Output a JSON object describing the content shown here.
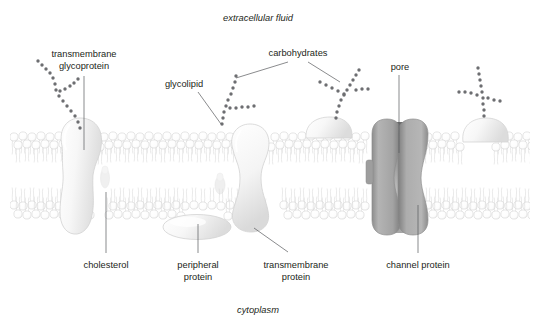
{
  "figure": {
    "title_visible": false,
    "background_color": "#ffffff"
  },
  "region_labels": {
    "extracellular": "extracellular fluid",
    "cytoplasm": "cytoplasm"
  },
  "labels": [
    {
      "id": "transmembrane-glycoprotein",
      "line1": "transmembrane",
      "line2": "glycoprotein"
    },
    {
      "id": "glycolipid",
      "line1": "glycolipid",
      "line2": ""
    },
    {
      "id": "carbohydrates",
      "line1": "carbohydrates",
      "line2": ""
    },
    {
      "id": "pore",
      "line1": "pore",
      "line2": ""
    },
    {
      "id": "cholesterol",
      "line1": "cholesterol",
      "line2": ""
    },
    {
      "id": "peripheral-protein",
      "line1": "peripheral",
      "line2": "protein"
    },
    {
      "id": "transmembrane-protein",
      "line1": "transmembrane",
      "line2": "protein"
    },
    {
      "id": "channel-protein",
      "line1": "channel protein",
      "line2": ""
    }
  ],
  "colors": {
    "text": "#231f20",
    "leader_line": "#58595b",
    "phospholipid_outline": "#d8d8d8",
    "phospholipid_fill": "#fbfbfb",
    "protein_light_fill": "#f2f2f2",
    "protein_light_stroke": "#d4d4d4",
    "channel_protein_fill": "#a9a9a9",
    "channel_protein_stroke": "#8f8f8f",
    "carbohydrate_bead": "#6d6e71",
    "background": "#ffffff"
  },
  "structures": [
    {
      "name": "phospholipid-bilayer",
      "description": "two leaflets of head-and-tail phospholipids"
    },
    {
      "name": "transmembrane-glycoprotein-body",
      "description": "large bulbous protein spanning the bilayer on the left"
    },
    {
      "name": "cholesterol-molecule",
      "description": "small faint molecule wedged between phospholipid tails"
    },
    {
      "name": "peripheral-protein-body",
      "description": "ellipse attached to the cytoplasmic face"
    },
    {
      "name": "transmembrane-protein-body",
      "description": "hourglass protein spanning the bilayer in the middle"
    },
    {
      "name": "channel-protein-body",
      "description": "two gray pillars forming a central pore"
    },
    {
      "name": "glycolipid-chain",
      "description": "branched carbohydrate chain attached to a lipid head"
    },
    {
      "name": "carbohydrate-chain",
      "description": "branched chain of sugar beads"
    }
  ]
}
